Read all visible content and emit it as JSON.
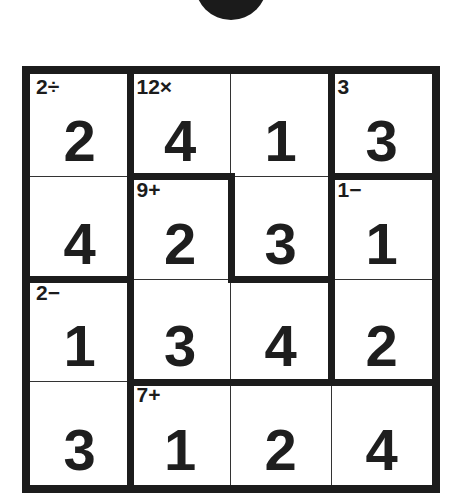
{
  "puzzle": {
    "type": "KenKen",
    "size": 4,
    "header_badge": "partially visible black circle",
    "cells": [
      [
        {
          "value": "2",
          "label": "2÷"
        },
        {
          "value": "4",
          "label": "12×"
        },
        {
          "value": "1",
          "label": ""
        },
        {
          "value": "3",
          "label": "3"
        }
      ],
      [
        {
          "value": "4",
          "label": ""
        },
        {
          "value": "2",
          "label": "9+"
        },
        {
          "value": "3",
          "label": ""
        },
        {
          "value": "1",
          "label": "1−"
        }
      ],
      [
        {
          "value": "1",
          "label": "2−"
        },
        {
          "value": "3",
          "label": ""
        },
        {
          "value": "4",
          "label": ""
        },
        {
          "value": "2",
          "label": ""
        }
      ],
      [
        {
          "value": "3",
          "label": ""
        },
        {
          "value": "1",
          "label": "7+"
        },
        {
          "value": "2",
          "label": ""
        },
        {
          "value": "4",
          "label": ""
        }
      ]
    ],
    "cages": [
      {
        "label": "2÷",
        "cells": [
          [
            0,
            0
          ],
          [
            1,
            0
          ]
        ]
      },
      {
        "label": "12×",
        "cells": [
          [
            0,
            1
          ],
          [
            0,
            2
          ],
          [
            1,
            2
          ]
        ]
      },
      {
        "label": "3",
        "cells": [
          [
            0,
            3
          ]
        ]
      },
      {
        "label": "9+",
        "cells": [
          [
            1,
            1
          ],
          [
            2,
            1
          ],
          [
            2,
            2
          ]
        ]
      },
      {
        "label": "1−",
        "cells": [
          [
            1,
            3
          ],
          [
            2,
            3
          ]
        ]
      },
      {
        "label": "2−",
        "cells": [
          [
            2,
            0
          ],
          [
            3,
            0
          ]
        ]
      },
      {
        "label": "7+",
        "cells": [
          [
            3,
            1
          ],
          [
            3,
            2
          ],
          [
            3,
            3
          ]
        ]
      }
    ]
  }
}
